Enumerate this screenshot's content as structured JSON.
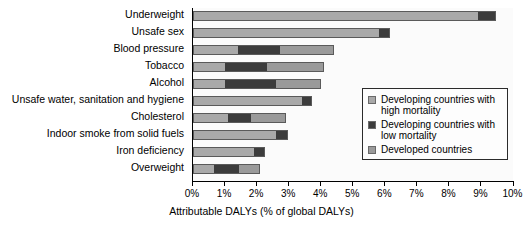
{
  "chart_data": {
    "type": "bar",
    "orientation": "horizontal",
    "stacked": true,
    "title": "",
    "xlabel": "Attributable DALYs (% of global DALYs)",
    "ylabel": "",
    "xlim": [
      0,
      10
    ],
    "xticks": [
      "0%",
      "1%",
      "2%",
      "3%",
      "4%",
      "5%",
      "6%",
      "7%",
      "8%",
      "9%",
      "10%"
    ],
    "grid": false,
    "legend_position": "center-right",
    "categories": [
      "Underweight",
      "Unsafe sex",
      "Blood pressure",
      "Tobacco",
      "Alcohol",
      "Unsafe water, sanitation and hygiene",
      "Cholesterol",
      "Indoor smoke from solid fuels",
      "Iron deficiency",
      "Overweight"
    ],
    "series": [
      {
        "name": "Developing countries with high mortality",
        "color": "#a9a9a9",
        "values": [
          8.9,
          5.8,
          1.4,
          1.0,
          1.0,
          3.4,
          1.1,
          2.6,
          1.9,
          0.65
        ]
      },
      {
        "name": "Developing countries with low mortality",
        "color": "#3c3c3c",
        "values": [
          0.55,
          0.35,
          1.3,
          1.3,
          1.6,
          0.3,
          0.7,
          0.35,
          0.35,
          0.8
        ]
      },
      {
        "name": "Developed countries",
        "color": "#9a9a9a",
        "values": [
          0.0,
          0.0,
          1.7,
          1.8,
          1.4,
          0.0,
          1.1,
          0.0,
          0.0,
          0.65
        ]
      }
    ],
    "totals": [
      9.45,
      6.15,
      4.4,
      4.1,
      4.0,
      3.7,
      2.9,
      2.95,
      2.25,
      2.1
    ]
  },
  "legend": {
    "items": [
      {
        "label": "Developing countries with high mortality"
      },
      {
        "label": "Developing countries with low mortality"
      },
      {
        "label": "Developed countries"
      }
    ]
  }
}
